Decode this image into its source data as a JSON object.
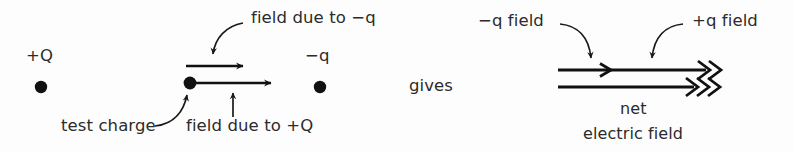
{
  "figure": {
    "colors": {
      "background": "#fdfdfd",
      "ink": "#111111",
      "text": "#2b2b2b",
      "leader": "#1a1a1a"
    }
  },
  "left_panel": {
    "name": "component fields at test charge",
    "charge_positions": {
      "source_positive_label": "+Q",
      "source_negative_label": "−q"
    },
    "labels": {
      "positive_source": "+Q",
      "negative_source": "−q",
      "field_due_to_negative": "field due to −q",
      "field_due_to_positive": "field due to +Q",
      "test_charge": "test charge"
    }
  },
  "connector": {
    "text": "gives"
  },
  "right_panel": {
    "name": "net field with component contributions",
    "labels": {
      "negative_field": "−q field",
      "positive_field": "+q field",
      "net": "net",
      "electric_field": "electric field"
    }
  }
}
